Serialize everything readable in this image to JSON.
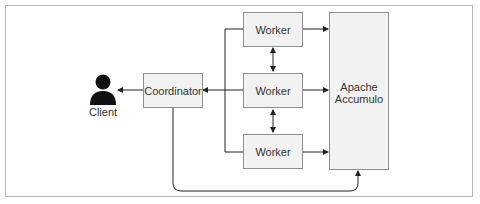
{
  "diagram": {
    "client": {
      "label": "Client",
      "icon": "person-icon"
    },
    "coordinator": {
      "label": "Coordinator"
    },
    "workers": [
      {
        "label": "Worker"
      },
      {
        "label": "Worker"
      },
      {
        "label": "Worker"
      }
    ],
    "storage": {
      "label_line1": "Apache",
      "label_line2": "Accumulo"
    },
    "edges": [
      {
        "from": "Coordinator",
        "to": "Client"
      },
      {
        "from": "Workers",
        "to": "Coordinator"
      },
      {
        "from": "Worker 1",
        "to": "Apache Accumulo"
      },
      {
        "from": "Worker 2",
        "to": "Apache Accumulo"
      },
      {
        "from": "Worker 3",
        "to": "Apache Accumulo"
      },
      {
        "from": "Worker 1",
        "to": "Worker 2",
        "bidirectional": true
      },
      {
        "from": "Worker 2",
        "to": "Worker 3",
        "bidirectional": true
      },
      {
        "from": "Coordinator",
        "to": "Apache Accumulo"
      }
    ],
    "colors": {
      "box_fill": "#f2f2f2",
      "box_border": "#8f8f8f",
      "line": "#222222",
      "frame": "#b8b8b8"
    }
  }
}
